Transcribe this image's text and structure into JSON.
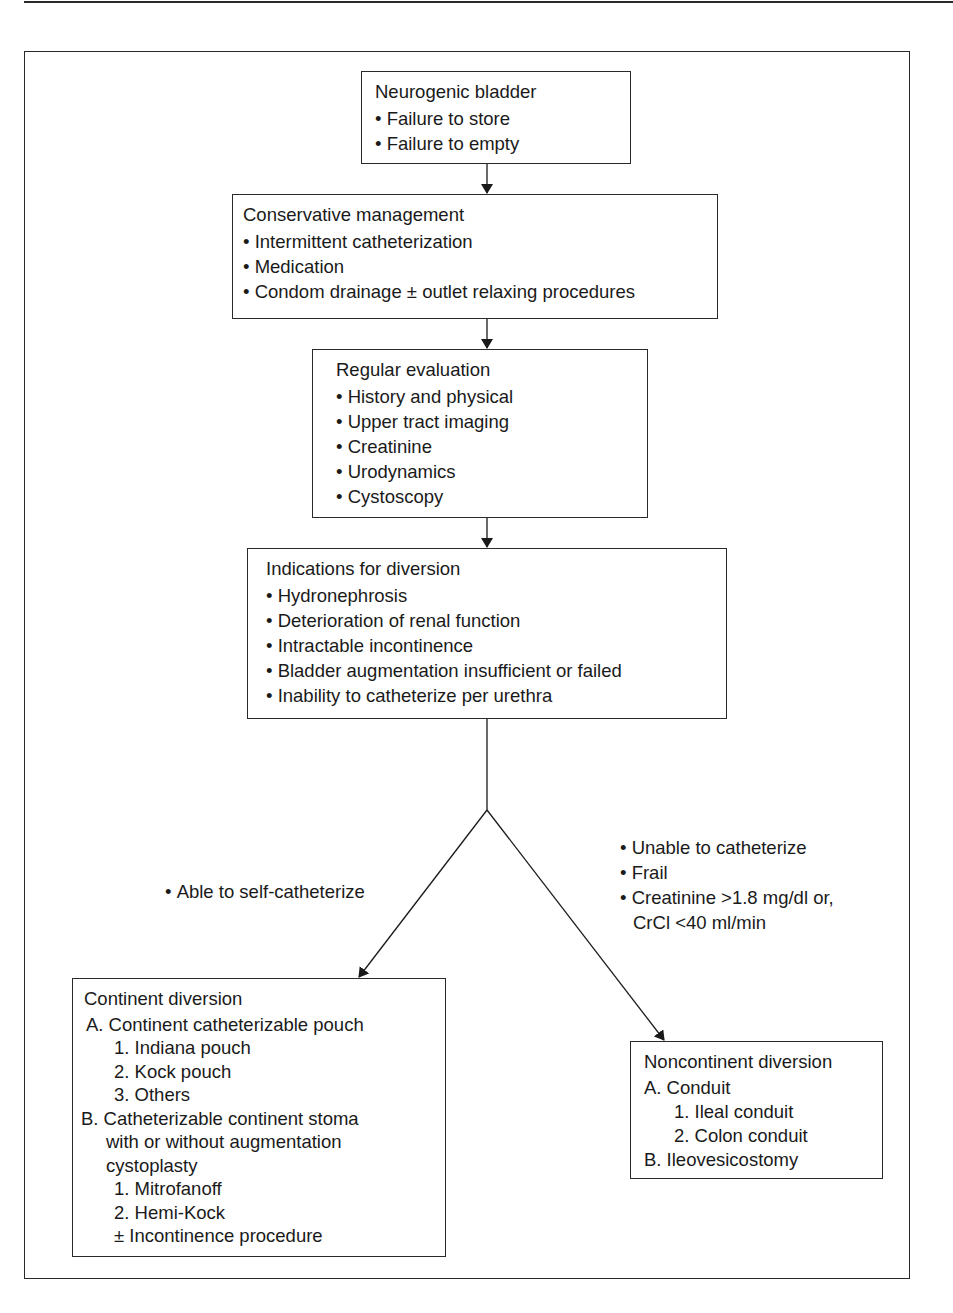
{
  "diagram": {
    "nodes": {
      "neurogenic": {
        "title": "Neurogenic bladder",
        "items": [
          "Failure to store",
          "Failure to empty"
        ]
      },
      "conservative": {
        "title": "Conservative management",
        "items": [
          "Intermittent catheterization",
          "Medication",
          "Condom drainage ± outlet relaxing procedures"
        ]
      },
      "evaluation": {
        "title": "Regular evaluation",
        "items": [
          "History and physical",
          "Upper tract imaging",
          "Creatinine",
          "Urodynamics",
          "Cystoscopy"
        ]
      },
      "indications": {
        "title": "Indications for diversion",
        "items": [
          "Hydronephrosis",
          "Deterioration of renal function",
          "Intractable incontinence",
          "Bladder augmentation insufficient or failed",
          "Inability to catheterize per urethra"
        ]
      },
      "continent": {
        "title": "Continent diversion",
        "a_label": "A. Continent catheterizable pouch",
        "a_items": [
          "1. Indiana pouch",
          "2. Kock pouch",
          "3. Others"
        ],
        "b_label_line1": "B. Catheterizable continent stoma",
        "b_label_line2": "with or without augmentation",
        "b_label_line3": "cystoplasty",
        "b_items": [
          "1. Mitrofanoff",
          "2. Hemi-Kock"
        ],
        "b_note": "± Incontinence procedure"
      },
      "noncontinent": {
        "title": "Noncontinent diversion",
        "a_label": "A. Conduit",
        "a_items": [
          "1. Ileal conduit",
          "2. Colon conduit"
        ],
        "b_label": "B. Ileovesicostomy"
      }
    },
    "edge_labels": {
      "left": [
        "Able to self-catheterize"
      ],
      "right": [
        "Unable to catheterize",
        "Frail",
        "Creatinine >1.8 mg/dl or,"
      ],
      "right_continuation": "CrCl <40 ml/min"
    }
  }
}
